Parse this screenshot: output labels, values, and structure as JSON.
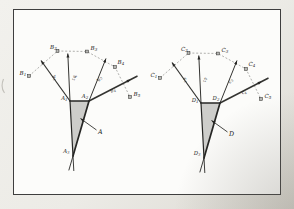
{
  "figure": {
    "style": {
      "background_top": "#f2f1ed",
      "background_bottom": "#dcdad3",
      "paper_color": "#fcfcfa",
      "frame_color": "#3e3e3e",
      "line_color": "#333330",
      "edge_color": "#262624",
      "dash_color": "#8f8f8c",
      "shade_color": "#c9c9c6",
      "marker_fill": "#b7b7b4",
      "label_color": "#232321"
    },
    "geometry": {
      "triangle": [
        [
          70,
          101
        ],
        [
          89,
          101
        ],
        [
          73,
          156
        ]
      ],
      "triangle_label_pos": [
        [
          67.5,
          99.5
        ],
        [
          85,
          97.5
        ],
        [
          69.5,
          153
        ]
      ],
      "triangle_label_anchor": [
        "end",
        "middle",
        "end"
      ],
      "side_extension": 15,
      "rays": [
        {
          "from": [
            70,
            101
          ],
          "to": [
            41,
            60.5
          ],
          "w": 1.2,
          "label_pos": [
            53.5,
            78.5
          ],
          "label_rot": 54
        },
        {
          "from": [
            70,
            101
          ],
          "to": [
            67.8,
            53.5
          ],
          "w": 1.0,
          "label_pos": [
            73.5,
            78
          ],
          "label_rot": 84
        },
        {
          "from": [
            89,
            101
          ],
          "to": [
            106,
            58.5
          ],
          "w": 1.0,
          "label_pos": [
            100.5,
            79.5
          ],
          "label_rot": -68
        },
        {
          "from": [
            89,
            101
          ],
          "to": [
            137.5,
            76
          ],
          "w": 1.5,
          "label_pos": [
            113.5,
            91.5
          ],
          "label_rot": -28,
          "head_at": 0.86
        }
      ],
      "squares": [
        [
          29,
          76
        ],
        [
          57.5,
          51
        ],
        [
          87,
          51.5
        ],
        [
          115,
          67
        ],
        [
          130,
          97
        ]
      ],
      "square_size": 2.8,
      "point_label_pos": [
        [
          19.5,
          74.5
        ],
        [
          50,
          48.5
        ],
        [
          90.5,
          49.5
        ],
        [
          117.5,
          64
        ],
        [
          133.5,
          96
        ]
      ],
      "pointer": {
        "from": [
          96.5,
          130
        ],
        "to": [
          80.5,
          118.5
        ],
        "label_pos": [
          98,
          133.5
        ]
      }
    },
    "diagrams": [
      {
        "id": "left",
        "offset": [
          0,
          0
        ],
        "triangle_labels": [
          "A1",
          "A2",
          "A3"
        ],
        "point_labels": [
          "B1",
          "B2",
          "B3",
          "B4",
          "B5"
        ],
        "ray_labels": [
          "b1",
          "b2",
          "b3",
          "b4"
        ],
        "pointer_label": "A"
      },
      {
        "id": "right",
        "offset": [
          131,
          2
        ],
        "triangle_labels": [
          "D1",
          "D2",
          "D3"
        ],
        "point_labels": [
          "C1",
          "C2",
          "C3",
          "C4",
          "C5"
        ],
        "ray_labels": [
          "c1",
          "c2",
          "c3",
          "c4"
        ],
        "pointer_label": "D"
      }
    ]
  }
}
